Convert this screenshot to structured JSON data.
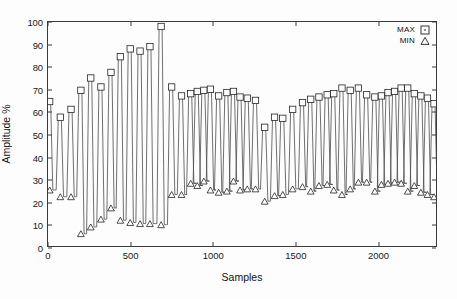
{
  "chart_data": {
    "type": "line",
    "title": "",
    "xlabel": "Samples",
    "ylabel": "Amplitude %",
    "xlim": [
      0,
      2360
    ],
    "ylim": [
      0,
      100
    ],
    "xticks": [
      0,
      500,
      1000,
      1500,
      2000
    ],
    "yticks": [
      0,
      10,
      20,
      30,
      40,
      50,
      60,
      70,
      80,
      90,
      100
    ],
    "grid": false,
    "legend_position": "top-right",
    "legend": [
      {
        "name": "MAX",
        "marker": "square"
      },
      {
        "name": "MIN",
        "marker": "triangle"
      }
    ],
    "x": [
      10,
      75,
      140,
      200,
      260,
      322,
      383,
      440,
      500,
      560,
      620,
      688,
      752,
      812,
      868,
      908,
      948,
      988,
      1038,
      1088,
      1128,
      1168,
      1212,
      1262,
      1318,
      1378,
      1428,
      1488,
      1548,
      1598,
      1648,
      1698,
      1738,
      1788,
      1838,
      1888,
      1938,
      1988,
      2028,
      2068,
      2108,
      2148,
      2188,
      2228,
      2268,
      2308,
      2348
    ],
    "series": [
      {
        "name": "MAX",
        "marker": "square",
        "values": [
          64.5,
          57.5,
          61.0,
          69.5,
          75.0,
          71.0,
          77.5,
          84.5,
          88.0,
          87.0,
          89.0,
          98.0,
          71.0,
          67.0,
          68.0,
          69.0,
          69.5,
          70.0,
          67.0,
          68.5,
          69.0,
          66.5,
          66.0,
          65.0,
          53.0,
          57.5,
          57.0,
          61.0,
          64.0,
          65.5,
          66.5,
          67.5,
          68.0,
          70.5,
          69.5,
          70.5,
          67.5,
          66.5,
          67.0,
          68.5,
          69.0,
          70.5,
          70.5,
          68.0,
          67.0,
          66.0,
          63.5
        ]
      },
      {
        "name": "MIN",
        "marker": "triangle",
        "values": [
          25.0,
          22.0,
          22.0,
          5.5,
          8.5,
          12.0,
          17.0,
          11.5,
          10.5,
          10.0,
          10.0,
          9.5,
          23.0,
          23.0,
          28.0,
          27.0,
          29.0,
          25.0,
          24.0,
          24.5,
          29.0,
          25.0,
          25.5,
          25.5,
          20.0,
          22.5,
          23.0,
          25.5,
          26.5,
          24.5,
          27.0,
          27.5,
          25.0,
          23.0,
          25.5,
          28.5,
          28.5,
          24.5,
          27.5,
          28.0,
          28.5,
          28.0,
          24.5,
          27.0,
          24.0,
          23.0,
          22.0
        ]
      }
    ]
  }
}
